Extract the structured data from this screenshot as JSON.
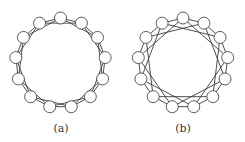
{
  "figure": {
    "panels": [
      {
        "id": "a",
        "caption": "(a)",
        "graph": {
          "type": "circulant",
          "node_count": 13,
          "connection_steps": [
            1,
            2
          ]
        }
      },
      {
        "id": "b",
        "caption": "(b)",
        "graph": {
          "type": "circulant",
          "node_count": 13,
          "connection_steps": [
            1,
            3
          ]
        }
      }
    ],
    "colors": {
      "edge": "#3a3a3a",
      "node_fill": "#ffffff",
      "node_stroke": "#4a4a4a"
    }
  }
}
